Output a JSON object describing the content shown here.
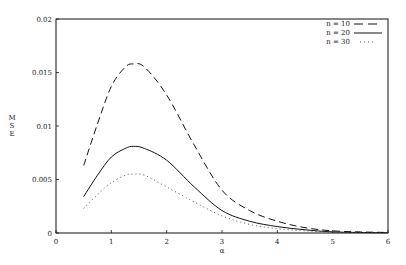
{
  "chart_data": {
    "type": "line",
    "title": "",
    "xlabel": "α",
    "ylabel": "MSE",
    "xlim": [
      0,
      6
    ],
    "ylim": [
      0,
      0.02
    ],
    "x_ticks": [
      "0",
      "1",
      "2",
      "3",
      "4",
      "5",
      "6"
    ],
    "y_ticks": [
      "0",
      "0.005",
      "0.01",
      "0.015",
      "0.02"
    ],
    "grid": false,
    "legend_position": "top-right",
    "x": [
      0.5,
      0.75,
      1.0,
      1.25,
      1.4,
      1.6,
      2.0,
      2.5,
      3.0,
      3.5,
      4.0,
      4.5,
      5.0,
      5.5,
      6.0
    ],
    "series": [
      {
        "name": "n = 10",
        "style": "dashed",
        "values": [
          0.0063,
          0.0102,
          0.0137,
          0.0155,
          0.0158,
          0.0155,
          0.0129,
          0.0082,
          0.004,
          0.0021,
          0.0011,
          0.0005,
          0.0002,
          0.0001,
          5e-05
        ]
      },
      {
        "name": "n = 20",
        "style": "solid",
        "values": [
          0.0034,
          0.0054,
          0.0071,
          0.0079,
          0.0081,
          0.0079,
          0.0068,
          0.0043,
          0.0021,
          0.0011,
          0.0006,
          0.0003,
          0.0001,
          5e-05,
          2e-05
        ]
      },
      {
        "name": "n = 30",
        "style": "dotted",
        "values": [
          0.0023,
          0.0036,
          0.0047,
          0.0054,
          0.0055,
          0.0054,
          0.0043,
          0.0029,
          0.0016,
          0.0008,
          0.0004,
          0.0002,
          7e-05,
          3e-05,
          1e-05
        ]
      }
    ]
  },
  "legend": {
    "items": [
      {
        "label": "n = 10"
      },
      {
        "label": "n = 20"
      },
      {
        "label": "n = 30"
      }
    ]
  },
  "axes": {
    "xlabel": "α",
    "ylabel_letters": [
      "M",
      "S",
      "E"
    ]
  }
}
